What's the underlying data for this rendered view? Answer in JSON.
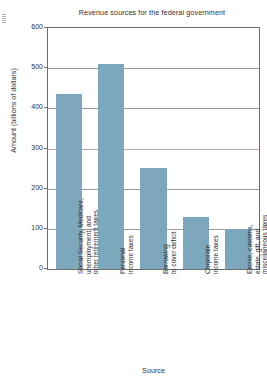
{
  "chart_data": {
    "type": "bar",
    "title": "Revenue sources for the federal government",
    "xlabel": "Source",
    "ylabel": "Amount (billions of dollars)",
    "ylim": [
      0,
      600
    ],
    "ytick_step": 100,
    "yticks": [
      "0",
      "100",
      "200",
      "300",
      "400",
      "500",
      "600"
    ],
    "grid": true,
    "legend": "none",
    "categories": [
      "Social Security, Medicare, unemployment, and other retirement taxes",
      "Personal income taxes",
      "Borrowing to cover deficit",
      "Corporate income taxes",
      "Excise, customs, estate, gift, and miscellaneous taxes"
    ],
    "category_lines": [
      [
        "Social Security, Medicare,",
        "unemployment, and",
        "other retirement taxes"
      ],
      [
        "Personal",
        "income taxes"
      ],
      [
        "Borrowing",
        "to cover deficit"
      ],
      [
        "Corporate",
        "income taxes"
      ],
      [
        "Excise, customs,",
        "estate, gift, and",
        "miscellaneous taxes"
      ]
    ],
    "values": [
      435,
      510,
      252,
      130,
      100
    ],
    "bar_color": "#7ca7bc"
  },
  "colors": {
    "bar": "#7ca7bc",
    "frame": "#6d6d6d",
    "grid": "#9a9a9a",
    "text": "#2f2f2f",
    "background": "#ffffff"
  }
}
